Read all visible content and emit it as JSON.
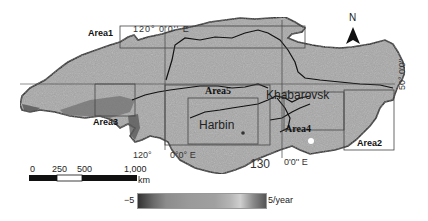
{
  "map": {
    "areas": [
      {
        "id": "area1",
        "label": "Area1"
      },
      {
        "id": "area2",
        "label": "Area2"
      },
      {
        "id": "area3",
        "label": "Area3"
      },
      {
        "id": "area4",
        "label": "Area4"
      },
      {
        "id": "area5",
        "label": "Area5"
      }
    ],
    "cities": [
      {
        "id": "harbin",
        "label": "Harbin"
      },
      {
        "id": "khabarovsk",
        "label": "Khabarovsk"
      }
    ],
    "coordinates": {
      "top_lon": "120°    0'0'' E",
      "bottom_lon_120": "120°",
      "bottom_lon_120_suffix": "0°0° E",
      "bottom_lon_130": "130",
      "bottom_lon_130_suffix": "0'0'' E",
      "right_lat": "50° 0'0''"
    },
    "north_arrow": {
      "label": "N",
      "icon": "north-arrow-icon"
    },
    "scale_bar": {
      "ticks": [
        "0",
        "250",
        "500",
        "1,000"
      ],
      "unit": "km"
    },
    "legend": {
      "min_label": "−5",
      "max_label": "5/year"
    },
    "colors": {
      "land": "#a6a6a6",
      "border": "#111111",
      "box": "#444444"
    }
  }
}
